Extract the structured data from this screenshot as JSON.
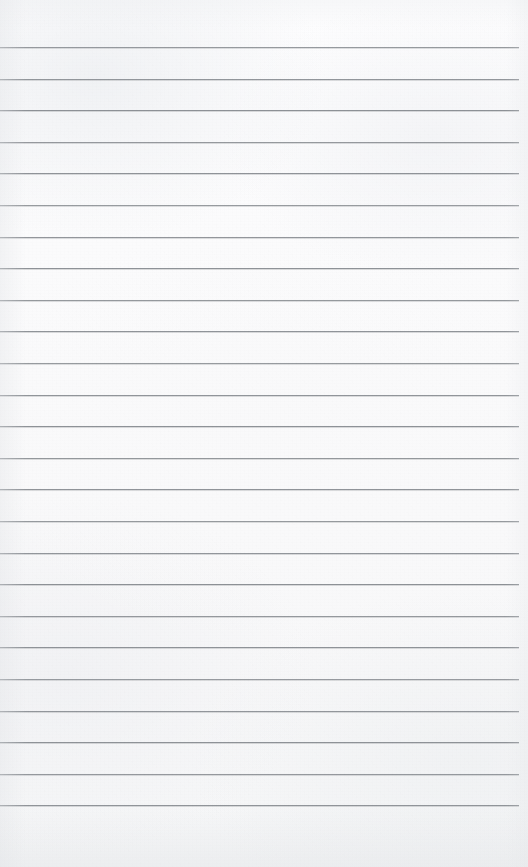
{
  "document": {
    "kind": "scanned-lined-paper",
    "title": "Blank ruled notebook page",
    "content_text": "",
    "page_width": 528,
    "page_height": 867,
    "background_color": "#fbfbfb",
    "rule_color": "#8d9196",
    "rule_thickness": 1,
    "rule_left": 0,
    "rule_right_end": 519,
    "first_rule_y": 47,
    "rule_spacing": 31.6,
    "rule_count": 25,
    "top_margin": 47,
    "bottom_margin": 49,
    "right_margin": 9,
    "has_vertical_margin_rule": false,
    "has_handwriting": false,
    "has_printed_text": false,
    "rule_y_positions": [
      47,
      78.6,
      110.2,
      141.8,
      173.4,
      205,
      236.6,
      268.2,
      299.8,
      331.4,
      363,
      394.6,
      426.2,
      457.8,
      489.4,
      521,
      552.6,
      584.2,
      615.8,
      647.4,
      679,
      710.6,
      742.2,
      773.8,
      805.4
    ]
  }
}
